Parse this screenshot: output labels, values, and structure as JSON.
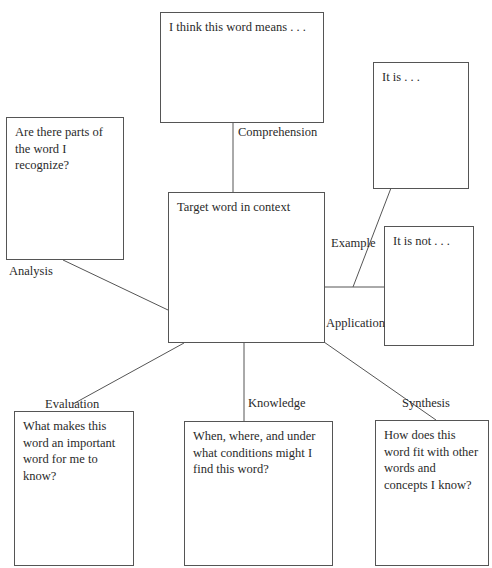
{
  "diagram": {
    "type": "vocabulary-word-map",
    "center": {
      "text": "Target word in context"
    },
    "boxes": {
      "comprehension": {
        "text": "I think this word means . . ."
      },
      "example_is": {
        "text": "It is . . ."
      },
      "example_is_not": {
        "text": "It is not . . ."
      },
      "analysis": {
        "text": "Are there parts of the word I recognize?"
      },
      "evaluation": {
        "text": "What makes this word an important word for me to know?"
      },
      "knowledge": {
        "text": "When, where, and under what conditions might I find this word?"
      },
      "synthesis": {
        "text": "How does this word fit with other words and concepts I know?"
      }
    },
    "labels": {
      "comprehension": "Comprehension",
      "example": "Example",
      "application": "Application",
      "analysis": "Analysis",
      "evaluation": "Evaluation",
      "knowledge": "Knowledge",
      "synthesis": "Synthesis"
    },
    "line_color": "#555555",
    "border_color": "#555555"
  }
}
